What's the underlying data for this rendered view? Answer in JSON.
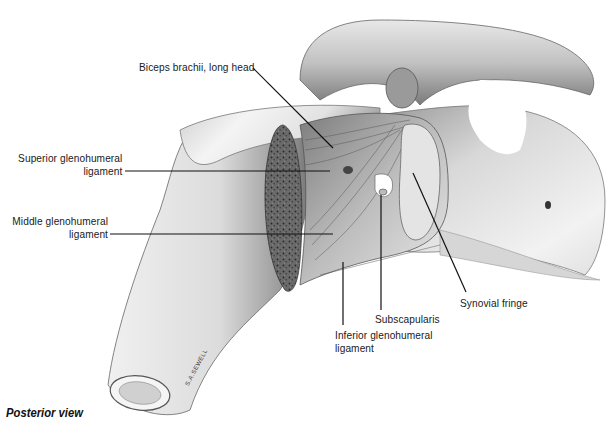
{
  "figure": {
    "caption": "Posterior view",
    "signature": "S.A.SEWELL",
    "colors": {
      "background": "#ffffff",
      "bone_light": "#f2f2f2",
      "bone_mid": "#c8c8c8",
      "bone_shadow": "#6e6e6e",
      "cancellous": "#5a5a5a",
      "leader_line": "#111111",
      "label_text": "#1a1a1a"
    },
    "labels": [
      {
        "id": "biceps",
        "line1": "Biceps brachii, long head",
        "line2": ""
      },
      {
        "id": "superior",
        "line1": "Superior glenohumeral",
        "line2": "ligament"
      },
      {
        "id": "middle",
        "line1": "Middle glenohumeral",
        "line2": "ligament"
      },
      {
        "id": "inferior",
        "line1": "Inferior glenohumeral",
        "line2": "ligament"
      },
      {
        "id": "subscapularis",
        "line1": "Subscapularis",
        "line2": ""
      },
      {
        "id": "synovial",
        "line1": "Synovial fringe",
        "line2": ""
      }
    ]
  }
}
